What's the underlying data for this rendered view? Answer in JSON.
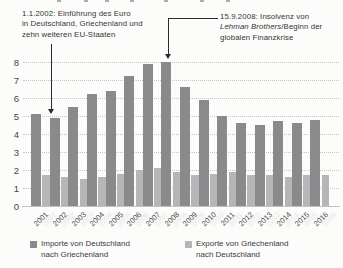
{
  "chart_data": {
    "type": "bar",
    "categories": [
      "2001",
      "2002",
      "2003",
      "2004",
      "2005",
      "2006",
      "2007",
      "2008",
      "2009",
      "2010",
      "2011",
      "2012",
      "2013",
      "2014",
      "2015",
      "2016"
    ],
    "series": [
      {
        "name": "Importe von Deutschland nach Griechenland",
        "color": "#8a8a8d",
        "values": [
          5.1,
          4.9,
          5.5,
          6.2,
          6.4,
          7.2,
          7.9,
          8.0,
          6.6,
          5.9,
          5.0,
          4.6,
          4.5,
          4.7,
          4.6,
          4.8
        ]
      },
      {
        "name": "Exporte von Griechenland nach Deutschland",
        "color": "#b6b6b8",
        "values": [
          1.7,
          1.6,
          1.5,
          1.6,
          1.8,
          2.0,
          2.1,
          1.9,
          1.7,
          1.8,
          1.9,
          1.7,
          1.7,
          1.6,
          1.7,
          1.7
        ]
      }
    ],
    "ylim": [
      0,
      8.3
    ],
    "yticks": [
      0,
      1,
      2,
      3,
      4,
      5,
      6,
      7,
      8
    ],
    "grid": "horizontal-dotted",
    "legend_position": "bottom"
  },
  "annotations": {
    "euro": {
      "lines": [
        "1.1.2002: Einführung des Euro",
        "in Deutschland, Griechenland und",
        "zehn weiteren EU-Staaten"
      ],
      "target_year": "2002"
    },
    "lehman": {
      "line1": "15.9.2008: Insolvenz von",
      "line2_italic": "Lehman Brothers",
      "line2_rest": "/Beginn der",
      "line3": "globalen Finanzkrise",
      "target_year": "2008"
    }
  },
  "legend": {
    "items": [
      {
        "line1": "Importe von Deutschland",
        "line2": "nach Griechenland",
        "color": "#8a8a8d"
      },
      {
        "line1": "Exporte von Griechenland",
        "line2": "nach Deutschland",
        "color": "#b6b6b8"
      }
    ]
  }
}
